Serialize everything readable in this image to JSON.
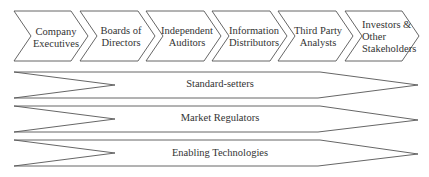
{
  "diagram": {
    "stages": [
      {
        "label": "Company\nExecutives"
      },
      {
        "label": "Boards of\nDirectors"
      },
      {
        "label": "Independent\nAuditors"
      },
      {
        "label": "Information\nDistributors"
      },
      {
        "label": "Third Party\nAnalysts"
      },
      {
        "label": "Investors &\nOther\nStakeholders"
      }
    ],
    "bars": [
      {
        "label": "Standard-setters"
      },
      {
        "label": "Market Regulators"
      },
      {
        "label": "Enabling Technologies"
      }
    ],
    "colors": {
      "stroke": "#555555",
      "fill": "#ffffff",
      "text": "#333333"
    }
  }
}
